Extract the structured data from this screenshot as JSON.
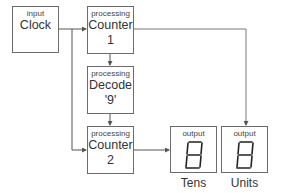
{
  "nodes": {
    "clock": {
      "kind": "input",
      "name": "Clock"
    },
    "counter1": {
      "kind": "processing",
      "line1": "Counter",
      "line2": "1"
    },
    "decode": {
      "kind": "processing",
      "line1": "Decode",
      "line2": "'9'"
    },
    "counter2": {
      "kind": "processing",
      "line1": "Counter",
      "line2": "2"
    },
    "tens": {
      "kind": "output",
      "caption": "Tens",
      "digit": "8"
    },
    "units": {
      "kind": "output",
      "caption": "Units",
      "digit": "8"
    }
  },
  "edges": [
    {
      "from": "clock",
      "to": "counter1"
    },
    {
      "from": "clock",
      "to": "counter2"
    },
    {
      "from": "counter1",
      "to": "decode"
    },
    {
      "from": "decode",
      "to": "counter2"
    },
    {
      "from": "counter1",
      "to": "units"
    },
    {
      "from": "counter2",
      "to": "tens"
    }
  ],
  "colors": {
    "line": "#6b6b6b",
    "text": "#333333"
  }
}
